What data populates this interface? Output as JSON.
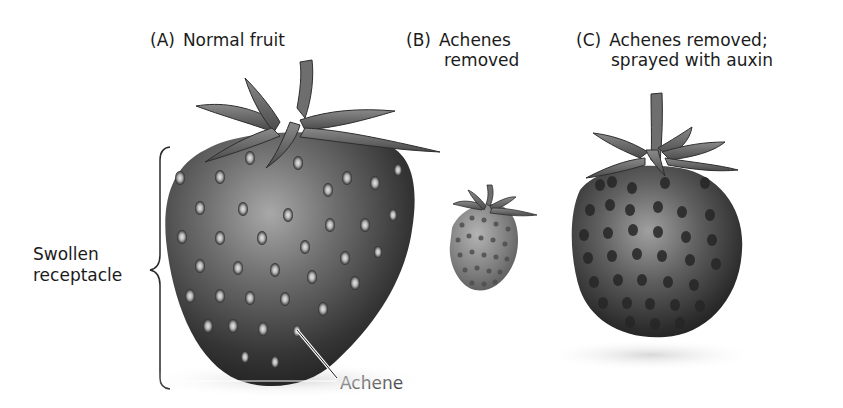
{
  "figure": {
    "panels": [
      {
        "id": "A",
        "tag": "(A)",
        "title_lines": [
          "Normal fruit"
        ]
      },
      {
        "id": "B",
        "tag": "(B)",
        "title_lines": [
          "Achenes",
          "removed"
        ]
      },
      {
        "id": "C",
        "tag": "(C)",
        "title_lines": [
          "Achenes removed;",
          "sprayed with auxin"
        ]
      }
    ],
    "annotations": {
      "receptacle_label_lines": [
        "Swollen",
        "receptacle"
      ],
      "achene_label": "Achene"
    }
  }
}
